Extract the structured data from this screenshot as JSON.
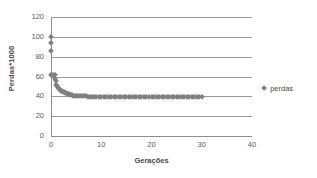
{
  "chart_data": {
    "type": "scatter",
    "title": "",
    "xlabel": "Gerações",
    "ylabel": "Perdas*1000",
    "xlim": [
      0,
      40
    ],
    "ylim": [
      0,
      120
    ],
    "xticks": [
      0,
      10,
      20,
      30,
      40
    ],
    "yticks": [
      0,
      20,
      40,
      60,
      80,
      100,
      120
    ],
    "grid": "horizontal",
    "legend_position": "right",
    "marker": "diamond",
    "marker_color": "#7f7f7f",
    "gridline_color": "#9a9a9a",
    "axis_color": "#8d8d8d",
    "series": [
      {
        "name": "perdas",
        "x": [
          0,
          0,
          0,
          0,
          0.35,
          0.7,
          0.7,
          1,
          1,
          1.2,
          1.4,
          1.6,
          1.8,
          2,
          2.2,
          2.4,
          2.6,
          2.8,
          3,
          3.2,
          3.5,
          3.8,
          4.1,
          4.4,
          4.7,
          5,
          5.4,
          5.8,
          6.2,
          6.6,
          7,
          7.4,
          7.8,
          8.2,
          8.6,
          9,
          9.5,
          10,
          10.5,
          11,
          11.5,
          12,
          12.5,
          13,
          13.5,
          14,
          14.5,
          15,
          15.5,
          16,
          16.5,
          17,
          17.5,
          18,
          18.5,
          19,
          19.5,
          20,
          20.5,
          21,
          21.5,
          22,
          22.5,
          23,
          23.5,
          24,
          24.5,
          25,
          25.5,
          26,
          26.5,
          27,
          27.5,
          28,
          28.5,
          29,
          29.5,
          30
        ],
        "y": [
          100,
          94,
          86,
          62,
          62,
          62,
          57,
          55,
          51,
          50,
          48,
          47,
          46,
          45.5,
          45,
          44.5,
          44,
          43.5,
          43,
          42.5,
          42,
          41.5,
          41,
          40.8,
          40.5,
          40.3,
          40.1,
          40,
          40,
          39.9,
          39.9,
          39.8,
          39.8,
          39.7,
          39.7,
          39.6,
          39.6,
          39.5,
          39.5,
          39.5,
          39.4,
          39.4,
          39.4,
          39.3,
          39.3,
          39.3,
          39.2,
          39.2,
          39.2,
          39.1,
          39.1,
          39.1,
          39.1,
          39,
          39,
          39,
          39,
          39,
          39,
          39,
          39,
          39,
          39,
          39,
          39,
          39,
          39,
          39,
          39,
          39,
          39,
          39,
          39,
          39,
          39,
          39,
          39,
          39
        ]
      }
    ]
  },
  "legend": {
    "entries": [
      {
        "label": "perdas"
      }
    ]
  }
}
